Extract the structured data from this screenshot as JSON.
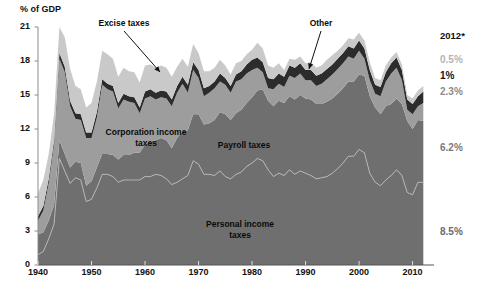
{
  "chart_data": {
    "type": "area",
    "title": "",
    "ylabel": "% of GDP",
    "xlabel": "",
    "ylim": [
      0,
      21
    ],
    "xlim": [
      1940,
      2014
    ],
    "grid": false,
    "stacked": true,
    "legend_position": "inline-annotations",
    "ytick_labels": [
      "0",
      "3",
      "6",
      "9",
      "12",
      "15",
      "18",
      "21"
    ],
    "ytick_values": [
      0,
      3,
      6,
      9,
      12,
      15,
      18,
      21
    ],
    "xtick_labels": [
      "1940",
      "1950",
      "1960",
      "1970",
      "1980",
      "1990",
      "2000",
      "2010"
    ],
    "xtick_values": [
      1940,
      1950,
      1960,
      1970,
      1980,
      1990,
      2000,
      2010
    ],
    "x": [
      1940,
      1941,
      1942,
      1943,
      1944,
      1945,
      1946,
      1947,
      1948,
      1949,
      1950,
      1951,
      1952,
      1953,
      1954,
      1955,
      1956,
      1957,
      1958,
      1959,
      1960,
      1961,
      1962,
      1963,
      1964,
      1965,
      1966,
      1967,
      1968,
      1969,
      1970,
      1971,
      1972,
      1973,
      1974,
      1975,
      1976,
      1977,
      1978,
      1979,
      1980,
      1981,
      1982,
      1983,
      1984,
      1985,
      1986,
      1987,
      1988,
      1989,
      1990,
      1991,
      1992,
      1993,
      1994,
      1995,
      1996,
      1997,
      1998,
      1999,
      2000,
      2001,
      2002,
      2003,
      2004,
      2005,
      2006,
      2007,
      2008,
      2009,
      2010,
      2011,
      2012
    ],
    "series": [
      {
        "name": "Personal income taxes",
        "color": "#6f6f6f",
        "values": [
          0.9,
          1.2,
          2.3,
          3.6,
          9.4,
          8.3,
          7.2,
          7.7,
          7.5,
          5.6,
          5.8,
          6.8,
          8.0,
          8.0,
          7.8,
          7.3,
          7.5,
          7.5,
          7.5,
          7.5,
          7.8,
          7.8,
          8.0,
          7.9,
          7.6,
          7.1,
          7.3,
          7.6,
          7.9,
          9.2,
          8.9,
          8.0,
          8.0,
          7.9,
          8.3,
          7.8,
          7.6,
          8.0,
          8.2,
          8.7,
          9.0,
          9.4,
          9.2,
          8.4,
          7.8,
          8.1,
          7.9,
          8.4,
          8.0,
          8.3,
          8.1,
          7.9,
          7.6,
          7.7,
          7.8,
          8.1,
          8.5,
          9.0,
          9.6,
          9.6,
          10.2,
          9.9,
          8.1,
          7.3,
          7.0,
          7.5,
          7.9,
          8.4,
          7.9,
          6.4,
          6.2,
          7.3,
          7.3
        ]
      },
      {
        "name": "Payroll taxes",
        "color": "#6f6f6f",
        "values": [
          1.8,
          1.7,
          1.6,
          1.7,
          1.6,
          1.5,
          1.4,
          1.4,
          1.5,
          1.4,
          1.6,
          1.8,
          1.8,
          1.8,
          1.9,
          2.0,
          2.2,
          2.2,
          2.4,
          2.4,
          2.8,
          3.1,
          3.0,
          3.3,
          3.4,
          3.2,
          3.9,
          4.2,
          4.0,
          4.1,
          4.4,
          4.4,
          4.5,
          4.9,
          5.2,
          5.5,
          5.2,
          5.4,
          5.5,
          5.6,
          5.8,
          6.0,
          6.3,
          6.1,
          6.2,
          6.4,
          6.4,
          6.5,
          6.6,
          6.7,
          6.6,
          6.7,
          6.6,
          6.5,
          6.6,
          6.6,
          6.6,
          6.6,
          6.6,
          6.6,
          6.6,
          6.8,
          6.8,
          6.6,
          6.3,
          6.5,
          6.3,
          6.3,
          6.3,
          6.3,
          5.8,
          5.5,
          5.4
        ]
      },
      {
        "name": "Corporation income taxes",
        "color": "#9d9d9d",
        "values": [
          1.2,
          1.9,
          3.3,
          5.3,
          7.2,
          7.2,
          5.4,
          3.8,
          3.8,
          4.2,
          3.8,
          4.4,
          6.1,
          5.7,
          5.6,
          4.5,
          4.9,
          4.7,
          4.4,
          3.5,
          4.1,
          4.0,
          3.6,
          3.6,
          3.7,
          3.7,
          4.0,
          4.2,
          3.3,
          3.9,
          3.2,
          2.5,
          2.7,
          2.8,
          2.7,
          2.6,
          2.4,
          2.8,
          2.7,
          2.6,
          2.4,
          2.0,
          1.5,
          1.1,
          1.5,
          1.5,
          1.4,
          1.8,
          1.9,
          1.9,
          1.6,
          1.7,
          1.6,
          1.8,
          2.0,
          2.1,
          2.2,
          2.2,
          2.2,
          2.0,
          2.1,
          1.5,
          1.4,
          1.2,
          1.6,
          2.2,
          2.7,
          2.7,
          2.1,
          1.0,
          1.3,
          1.2,
          1.6
        ]
      },
      {
        "name": "Other",
        "color": "#2c2c2c",
        "values": [
          0.4,
          0.4,
          0.4,
          0.4,
          0.5,
          0.5,
          0.5,
          0.5,
          0.5,
          0.5,
          0.5,
          0.5,
          0.5,
          0.5,
          0.5,
          0.5,
          0.5,
          0.5,
          0.5,
          0.5,
          0.6,
          0.6,
          0.6,
          0.6,
          0.6,
          0.6,
          0.6,
          0.6,
          0.7,
          0.7,
          0.7,
          0.7,
          0.6,
          0.6,
          0.7,
          0.6,
          0.6,
          0.6,
          0.7,
          0.8,
          0.9,
          0.9,
          0.9,
          0.9,
          0.9,
          0.9,
          0.9,
          0.9,
          0.9,
          0.9,
          0.9,
          0.9,
          0.9,
          0.9,
          0.9,
          0.9,
          0.9,
          0.9,
          0.9,
          0.9,
          0.9,
          0.9,
          0.9,
          0.8,
          0.8,
          0.8,
          0.9,
          0.9,
          0.9,
          0.9,
          0.9,
          0.9,
          1.0
        ]
      },
      {
        "name": "Excise taxes",
        "color": "#c9c9c9",
        "values": [
          2.0,
          2.3,
          2.2,
          2.3,
          2.3,
          2.6,
          2.8,
          2.4,
          2.2,
          2.2,
          2.6,
          2.7,
          2.5,
          2.6,
          2.4,
          2.3,
          2.3,
          2.2,
          2.2,
          2.2,
          2.3,
          2.2,
          2.2,
          2.2,
          2.1,
          2.0,
          1.7,
          1.6,
          1.6,
          1.6,
          1.5,
          1.5,
          1.3,
          1.2,
          1.2,
          1.1,
          1.0,
          1.0,
          0.9,
          0.9,
          0.9,
          1.3,
          1.2,
          1.1,
          1.0,
          0.9,
          0.6,
          0.6,
          0.7,
          0.6,
          0.6,
          0.7,
          0.7,
          0.7,
          0.8,
          0.8,
          0.7,
          0.7,
          0.7,
          0.8,
          0.7,
          0.7,
          0.7,
          0.6,
          0.6,
          0.6,
          0.5,
          0.5,
          0.5,
          0.4,
          0.5,
          0.5,
          0.5
        ]
      }
    ],
    "annotations": [
      {
        "name": "excise-taxes",
        "text": "Excise taxes",
        "x_pixel": 124,
        "y_pixel": 18,
        "arrow_to_x": 160,
        "arrow_to_y": 72
      },
      {
        "name": "corporation-income-taxes",
        "text": "Corporation income\ntaxes",
        "x_pixel": 146,
        "y_pixel": 127
      },
      {
        "name": "payroll-taxes",
        "text": "Payroll taxes",
        "x_pixel": 244,
        "y_pixel": 140
      },
      {
        "name": "personal-income-taxes",
        "text": "Personal income\ntaxes",
        "x_pixel": 240,
        "y_pixel": 219
      },
      {
        "name": "other",
        "text": "Other",
        "x_pixel": 321,
        "y_pixel": 18,
        "arrow_to_x": 309,
        "arrow_to_y": 69
      }
    ],
    "right_column": {
      "header": "2012*",
      "entries": [
        {
          "label": "0.5%",
          "series": "Excise taxes",
          "color": "#b4b4b4",
          "y_pixel": 61
        },
        {
          "label": "1%",
          "series": "Other",
          "color": "#141414",
          "y_pixel": 77
        },
        {
          "label": "2.3%",
          "series": "Corporation income taxes",
          "color": "#8c8c8c",
          "y_pixel": 93
        },
        {
          "label": "6.2%",
          "series": "Payroll taxes",
          "color": "#7a7a7a",
          "y_pixel": 149
        },
        {
          "label": "8.5%",
          "series": "Personal income taxes",
          "color": "#6b6b6b",
          "y_pixel": 233
        }
      ]
    }
  },
  "axis": {
    "y_title": "% of GDP"
  }
}
